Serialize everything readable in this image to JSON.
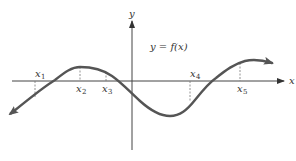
{
  "diagram": {
    "equation_label": "y = f(x)",
    "axes": {
      "x_label": "x",
      "y_label": "y"
    },
    "points": [
      {
        "name": "x",
        "sub": "1",
        "position": "below curve minimum side, curve below axis"
      },
      {
        "name": "x",
        "sub": "2",
        "position": "local maximum"
      },
      {
        "name": "x",
        "sub": "3",
        "position": "curve above axis, decreasing"
      },
      {
        "name": "x",
        "sub": "4",
        "position": "curve below axis, increasing"
      },
      {
        "name": "x",
        "sub": "5",
        "position": "curve above axis, increasing"
      }
    ],
    "colors": {
      "curve": "#555555",
      "axes": "#444444",
      "dashes": "#777777",
      "text": "#333333"
    }
  }
}
